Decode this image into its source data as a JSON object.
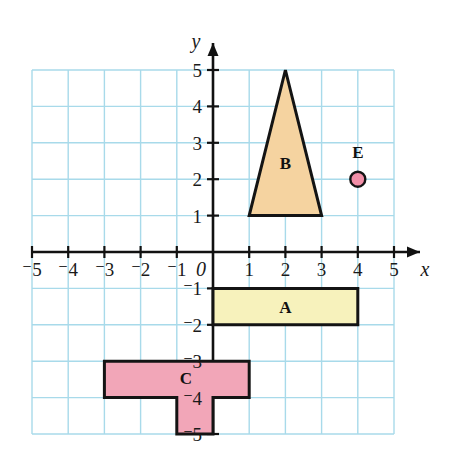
{
  "figure": {
    "type": "coordinate-grid",
    "title": "",
    "background_color": "#ffffff",
    "grid_color": "#a8daea",
    "axis_color": "#111111",
    "outline_color": "#141414"
  },
  "axes": {
    "x": {
      "name": "x",
      "min": -5,
      "max": 5,
      "tick_labels": [
        "⁻5",
        "⁻4",
        "⁻3",
        "⁻2",
        "⁻1",
        "1",
        "2",
        "3",
        "4",
        "5"
      ],
      "tick_values": [
        -5,
        -4,
        -3,
        -2,
        -1,
        1,
        2,
        3,
        4,
        5
      ],
      "arrow": "right"
    },
    "y": {
      "name": "y",
      "min": -5,
      "max": 5,
      "tick_labels": [
        "5",
        "4",
        "3",
        "2",
        "1",
        "⁻1",
        "⁻2",
        "⁻3",
        "⁻4",
        "⁻5"
      ],
      "tick_values": [
        5,
        4,
        3,
        2,
        1,
        -1,
        -2,
        -3,
        -4,
        -5
      ],
      "arrow": "up"
    },
    "origin_label": "0"
  },
  "shapes": [
    {
      "id": "A",
      "label": "A",
      "kind": "rectangle",
      "fill": "#f7f2bc",
      "stroke": "#141414",
      "points": [
        [
          0,
          -1
        ],
        [
          4,
          -1
        ],
        [
          4,
          -2
        ],
        [
          0,
          -2
        ]
      ],
      "label_at": [
        2,
        -1.5
      ]
    },
    {
      "id": "B",
      "label": "B",
      "kind": "triangle",
      "fill": "#f5d3a0",
      "stroke": "#141414",
      "points": [
        [
          2,
          5
        ],
        [
          3,
          1
        ],
        [
          1,
          1
        ]
      ],
      "label_at": [
        2,
        2.45
      ]
    },
    {
      "id": "C",
      "label": "C",
      "kind": "t-shape",
      "fill": "#f2a6b8",
      "stroke": "#141414",
      "points": [
        [
          -3,
          -3
        ],
        [
          1,
          -3
        ],
        [
          1,
          -4
        ],
        [
          0,
          -4
        ],
        [
          0,
          -5
        ],
        [
          -1,
          -5
        ],
        [
          -1,
          -4
        ],
        [
          -3,
          -4
        ]
      ],
      "label_at": [
        -0.75,
        -3.45
      ]
    },
    {
      "id": "E",
      "label": "E",
      "kind": "point",
      "fill": "#f28fa8",
      "stroke": "#141414",
      "points": [
        [
          4,
          2
        ]
      ],
      "label_at": [
        4,
        2.75
      ]
    }
  ],
  "chart_data": {
    "type": "scatter",
    "title": "",
    "xlabel": "x",
    "ylabel": "y",
    "xlim": [
      -5,
      5
    ],
    "ylim": [
      -5,
      5
    ],
    "grid": true,
    "legend": "none",
    "annotations": [
      "A",
      "B",
      "C",
      "E"
    ],
    "series": [
      {
        "name": "A",
        "vertices": [
          [
            0,
            -1
          ],
          [
            4,
            -1
          ],
          [
            4,
            -2
          ],
          [
            0,
            -2
          ]
        ]
      },
      {
        "name": "B",
        "vertices": [
          [
            2,
            5
          ],
          [
            3,
            1
          ],
          [
            1,
            1
          ]
        ]
      },
      {
        "name": "C",
        "vertices": [
          [
            -3,
            -3
          ],
          [
            1,
            -3
          ],
          [
            1,
            -4
          ],
          [
            0,
            -4
          ],
          [
            0,
            -5
          ],
          [
            -1,
            -5
          ],
          [
            -1,
            -4
          ],
          [
            -3,
            -4
          ]
        ]
      },
      {
        "name": "E",
        "vertices": [
          [
            4,
            2
          ]
        ]
      }
    ]
  }
}
